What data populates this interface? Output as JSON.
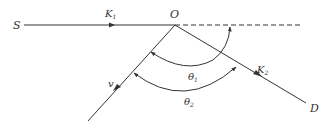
{
  "diagram": {
    "points": {
      "S": {
        "label": "S"
      },
      "O": {
        "label": "O"
      },
      "D": {
        "label": "D"
      }
    },
    "vectors": {
      "k1": {
        "label": "K",
        "subscript": "1"
      },
      "k2": {
        "label": "K",
        "subscript": "2"
      },
      "v": {
        "label": "v"
      }
    },
    "angles": {
      "theta1": {
        "label": "θ",
        "subscript": "1"
      },
      "theta2": {
        "label": "θ",
        "subscript": "2"
      }
    },
    "colors": {
      "line": "#333333",
      "background": "#ffffff"
    }
  }
}
